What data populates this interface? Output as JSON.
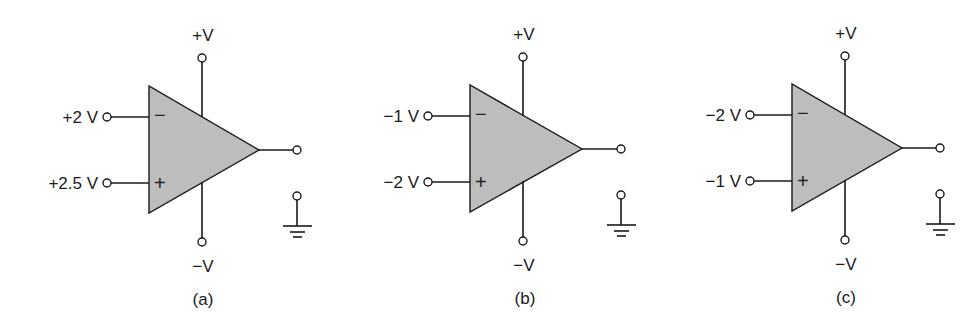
{
  "figure": {
    "colors": {
      "ink": "#1a1a1a",
      "opamp_fill": "#bdbdbd",
      "background": "#ffffff"
    },
    "circuits": [
      {
        "id": "a",
        "caption": "(a)",
        "inverting_input": {
          "label": "+2 V",
          "sign": "−"
        },
        "noninverting_input": {
          "label": "+2.5 V",
          "sign": "+"
        },
        "positive_supply": "+V",
        "negative_supply": "−V",
        "output": "output-terminal",
        "ground": "ground-symbol"
      },
      {
        "id": "b",
        "caption": "(b)",
        "inverting_input": {
          "label": "−1 V",
          "sign": "−"
        },
        "noninverting_input": {
          "label": "−2 V",
          "sign": "+"
        },
        "positive_supply": "+V",
        "negative_supply": "−V",
        "output": "output-terminal",
        "ground": "ground-symbol"
      },
      {
        "id": "c",
        "caption": "(c)",
        "inverting_input": {
          "label": "−2 V",
          "sign": "−"
        },
        "noninverting_input": {
          "label": "−1 V",
          "sign": "+"
        },
        "positive_supply": "+V",
        "negative_supply": "−V",
        "output": "output-terminal",
        "ground": "ground-symbol"
      }
    ]
  }
}
